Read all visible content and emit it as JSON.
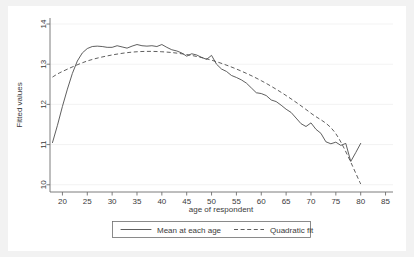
{
  "chart_data": {
    "type": "line",
    "title": "",
    "xlabel": "age of respondent",
    "ylabel": "Fitted values",
    "xlim": [
      17.5,
      86.5
    ],
    "ylim": [
      9.82,
      14.15
    ],
    "xticks": [
      20,
      25,
      30,
      35,
      40,
      45,
      50,
      55,
      60,
      65,
      70,
      75,
      80,
      85
    ],
    "yticks": [
      10,
      11,
      12,
      13,
      14
    ],
    "grid": "horizontal",
    "legend_position": "bottom",
    "series": [
      {
        "name": "Mean at each age",
        "style": "solid",
        "x": [
          18,
          19,
          20,
          21,
          22,
          23,
          24,
          25,
          26,
          27,
          28,
          29,
          30,
          31,
          32,
          33,
          34,
          35,
          36,
          37,
          38,
          39,
          40,
          41,
          42,
          43,
          44,
          45,
          46,
          47,
          48,
          49,
          50,
          51,
          52,
          53,
          54,
          55,
          56,
          57,
          58,
          59,
          60,
          61,
          62,
          63,
          64,
          65,
          66,
          67,
          68,
          69,
          70,
          71,
          72,
          73,
          74,
          75,
          76,
          77,
          78,
          79,
          80
        ],
        "values": [
          11.05,
          11.48,
          11.95,
          12.38,
          12.77,
          13.08,
          13.28,
          13.39,
          13.44,
          13.45,
          13.44,
          13.42,
          13.42,
          13.46,
          13.43,
          13.4,
          13.45,
          13.49,
          13.46,
          13.45,
          13.46,
          13.44,
          13.49,
          13.42,
          13.36,
          13.33,
          13.28,
          13.2,
          13.26,
          13.23,
          13.17,
          13.12,
          13.22,
          13.0,
          12.88,
          12.82,
          12.72,
          12.67,
          12.61,
          12.53,
          12.41,
          12.29,
          12.27,
          12.22,
          12.11,
          12.07,
          11.98,
          11.88,
          11.8,
          11.66,
          11.52,
          11.45,
          11.54,
          11.38,
          11.28,
          11.07,
          11.02,
          11.06,
          10.98,
          11.03,
          10.58,
          10.8,
          11.03
        ]
      },
      {
        "name": "Quadratic fit",
        "style": "dashed",
        "x": [
          18,
          20,
          25,
          30,
          35,
          40,
          45,
          50,
          55,
          60,
          65,
          70,
          75,
          80
        ],
        "values": [
          12.68,
          12.82,
          13.08,
          13.23,
          13.31,
          13.31,
          13.24,
          13.1,
          12.88,
          12.59,
          12.22,
          11.78,
          11.27,
          10.02
        ]
      }
    ]
  },
  "axes": {
    "y_title": "Fitted values",
    "x_title": "age of respondent",
    "y_tick_labels": [
      "10",
      "11",
      "12",
      "13",
      "14"
    ],
    "x_tick_labels": [
      "20",
      "25",
      "30",
      "35",
      "40",
      "45",
      "50",
      "55",
      "60",
      "65",
      "70",
      "75",
      "80",
      "85"
    ]
  },
  "legend": {
    "entries": [
      {
        "label": "Mean at each age",
        "style": "solid"
      },
      {
        "label": "Quadratic fit",
        "style": "dashed"
      }
    ]
  },
  "colors": {
    "line": "#4d4d4d",
    "axis": "#6e6e6e",
    "grid": "#f0f0f0",
    "plot_background": "#ffffff",
    "figure_background": "#f2f2f2"
  }
}
